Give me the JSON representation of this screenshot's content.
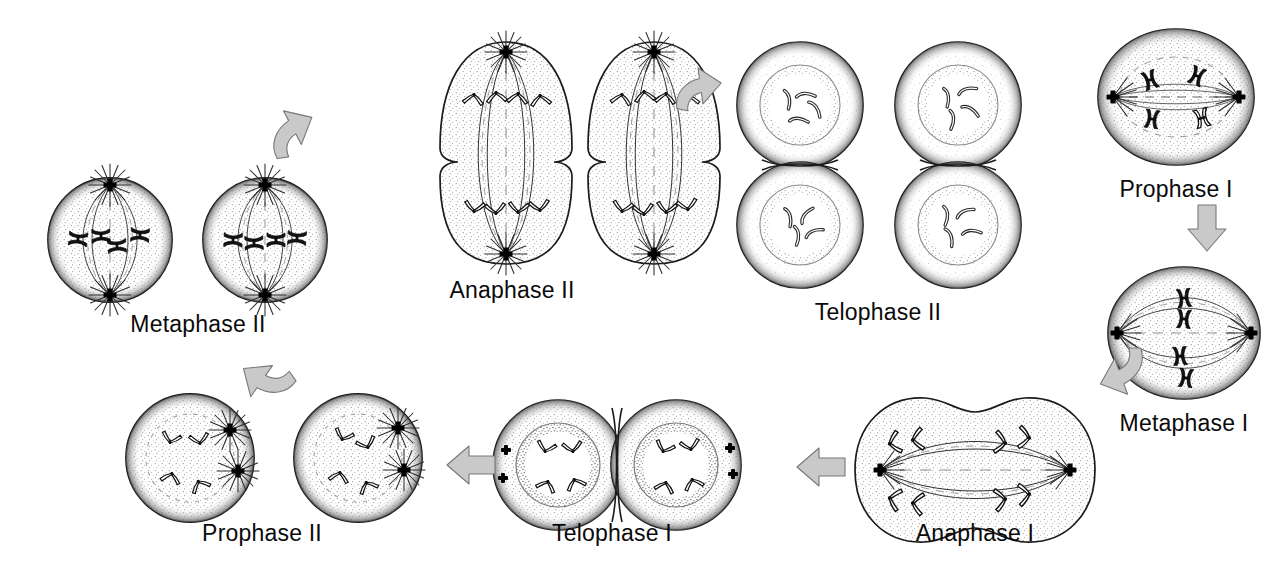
{
  "diagram": {
    "background_color": "#ffffff",
    "ink_color": "#101010",
    "arrow_fill_color": "#c9c9c9",
    "arrow_stroke_color": "#6e6e6e",
    "cytoplasm_stipple_color": "#9a9a9a",
    "stages": [
      {
        "id": "prophase-1",
        "label": "Prophase I",
        "order": 1,
        "cell_count": 1,
        "shape": "single-round-cell",
        "features": "paired homologous chromosomes (tetrads), two asters/centrosomes at poles, spindle fibers, nuclear envelope breaking down",
        "label_x": 1176,
        "label_y": 190
      },
      {
        "id": "metaphase-1",
        "label": "Metaphase I",
        "order": 2,
        "cell_count": 1,
        "shape": "single-round-cell",
        "features": "tetrads aligned on metaphase plate, spindle fibers from both poles",
        "label_x": 1184,
        "label_y": 424
      },
      {
        "id": "anaphase-1",
        "label": "Anaphase I",
        "order": 3,
        "cell_count": 1,
        "shape": "elongated-dumbbell-cell",
        "features": "homologous chromosomes pulled to opposite poles, cell elongating with cleavage furrow",
        "label_x": 975,
        "label_y": 534
      },
      {
        "id": "telophase-1",
        "label": "Telophase I",
        "order": 4,
        "cell_count": 2,
        "shape": "two-daughter-cells-horizontal",
        "features": "two daughter cells with re-forming nuclear envelopes, chromosomes inside, centrioles outside",
        "label_x": 612,
        "label_y": 534
      },
      {
        "id": "prophase-2",
        "label": "Prophase II",
        "order": 5,
        "cell_count": 2,
        "shape": "two-round-cells-horizontal",
        "features": "nuclear envelope dispersing, asters forming at two poles in each daughter cell",
        "label_x": 262,
        "label_y": 534
      },
      {
        "id": "metaphase-2",
        "label": "Metaphase II",
        "order": 6,
        "cell_count": 2,
        "shape": "two-round-cells-horizontal",
        "features": "sister chromatids aligned at equator, full spindle with poles top and bottom",
        "label_x": 198,
        "label_y": 325
      },
      {
        "id": "anaphase-2",
        "label": "Anaphase II",
        "order": 7,
        "cell_count": 2,
        "shape": "two-elongated-dumbbell-cells",
        "features": "sister chromatids separating toward opposite poles, cells constricting at midline",
        "label_x": 512,
        "label_y": 291
      },
      {
        "id": "telophase-2",
        "label": "Telophase II",
        "order": 8,
        "cell_count": 4,
        "shape": "four-daughter-cells-two-pairs",
        "features": "four haploid daughter cells with re-formed nuclear envelopes containing decondensing chromosomes",
        "label_x": 878,
        "label_y": 313
      }
    ],
    "arrows": [
      {
        "id": "arrow-prophase1-to-metaphase1",
        "from": "Prophase I",
        "to": "Metaphase I",
        "direction": "down",
        "style": "straight-block"
      },
      {
        "id": "arrow-metaphase1-to-anaphase1",
        "from": "Metaphase I",
        "to": "Anaphase I",
        "direction": "down-left",
        "style": "bent-block"
      },
      {
        "id": "arrow-anaphase1-to-telophase1",
        "from": "Anaphase I",
        "to": "Telophase I",
        "direction": "left",
        "style": "straight-block"
      },
      {
        "id": "arrow-telophase1-to-prophase2",
        "from": "Telophase I",
        "to": "Prophase II",
        "direction": "left",
        "style": "straight-block"
      },
      {
        "id": "arrow-prophase2-to-metaphase2",
        "from": "Prophase II",
        "to": "Metaphase II",
        "direction": "up-left",
        "style": "bent-block"
      },
      {
        "id": "arrow-metaphase2-to-anaphase2",
        "from": "Metaphase II",
        "to": "Anaphase II",
        "direction": "up-right",
        "style": "bent-block"
      },
      {
        "id": "arrow-anaphase2-to-telophase2",
        "from": "Anaphase II",
        "to": "Telophase II",
        "direction": "right",
        "style": "bent-block"
      }
    ]
  }
}
